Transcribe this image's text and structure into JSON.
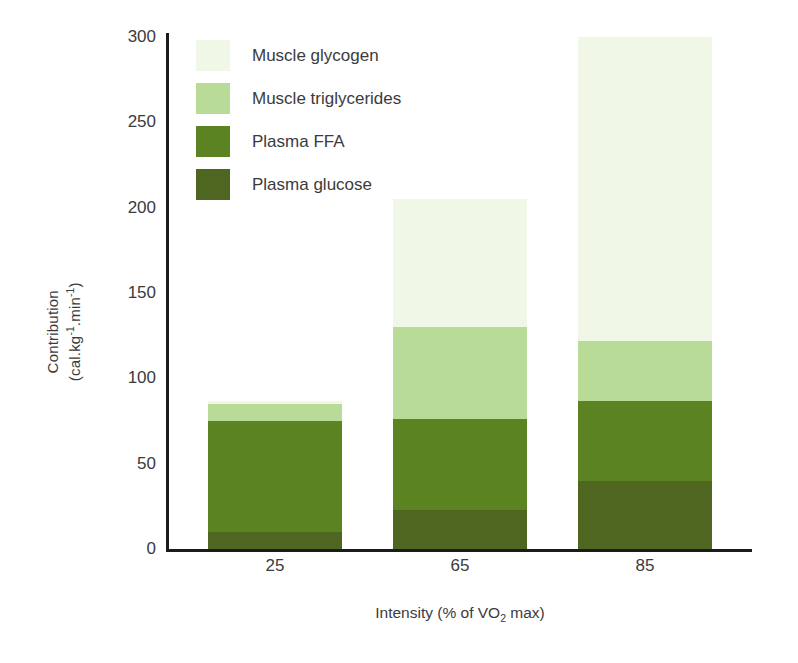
{
  "chart_data": {
    "type": "bar",
    "stacked": true,
    "title": "",
    "xlabel": "Intensity (% of VO2 max)",
    "xlabel_parts": {
      "pre": "Intensity (% of VO",
      "sub": "2",
      "post": " max)"
    },
    "ylabel_line1": "Contribution",
    "ylabel_line2_parts": {
      "a": "(cal.kg",
      "sup1": "-1",
      "b": ".min",
      "sup2": "-1",
      "c": ")"
    },
    "categories": [
      "25",
      "65",
      "85"
    ],
    "ylim": [
      0,
      300
    ],
    "yticks": [
      "0",
      "50",
      "100",
      "150",
      "200",
      "250",
      "300"
    ],
    "ytick_values": [
      0,
      50,
      100,
      150,
      200,
      250,
      300
    ],
    "grid": false,
    "legend_position": "upper-left-inside",
    "series": [
      {
        "name": "Plasma glucose",
        "color": "#4f6620",
        "values": [
          10,
          23,
          40
        ]
      },
      {
        "name": "Plasma FFA",
        "color": "#5b8322",
        "values": [
          65,
          53,
          47
        ]
      },
      {
        "name": "Muscle triglycerides",
        "color": "#b8dc97",
        "values": [
          10,
          54,
          35
        ]
      },
      {
        "name": "Muscle glycogen",
        "color": "#f0f7e6",
        "values": [
          2,
          75,
          178
        ]
      }
    ],
    "totals": [
      87,
      205,
      300
    ],
    "legend_order": [
      "Muscle glycogen",
      "Muscle triglycerides",
      "Plasma FFA",
      "Plasma glucose"
    ],
    "legend": [
      {
        "label": "Muscle glycogen",
        "color": "#f0f7e6"
      },
      {
        "label": "Muscle triglycerides",
        "color": "#b8dc97"
      },
      {
        "label": "Plasma FFA",
        "color": "#5b8322"
      },
      {
        "label": "Plasma glucose",
        "color": "#4f6620"
      }
    ],
    "axis_color": "#1b1b1b",
    "text_color": "#3b3b3b",
    "background": "#ffffff"
  }
}
